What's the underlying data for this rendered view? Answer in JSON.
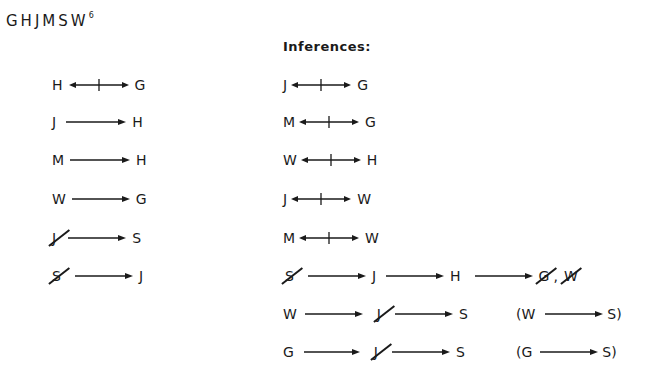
{
  "title": {
    "letters": "GHJMSW",
    "superscript": "6"
  },
  "inferences_heading": "Inferences:",
  "rules": [
    {
      "from": "H",
      "from_neg": false,
      "type": "not-both",
      "to": "G",
      "to_neg": false
    },
    {
      "from": "J",
      "from_neg": false,
      "type": "implies",
      "to": "H",
      "to_neg": false
    },
    {
      "from": "M",
      "from_neg": false,
      "type": "implies",
      "to": "H",
      "to_neg": false
    },
    {
      "from": "W",
      "from_neg": false,
      "type": "implies",
      "to": "G",
      "to_neg": false
    },
    {
      "from": "J",
      "from_neg": true,
      "type": "implies",
      "to": "S",
      "to_neg": false
    },
    {
      "from": "S",
      "from_neg": true,
      "type": "implies",
      "to": "J",
      "to_neg": false
    }
  ],
  "inferences": [
    {
      "from": "J",
      "to": "G",
      "type": "not-both"
    },
    {
      "from": "M",
      "to": "G",
      "type": "not-both"
    },
    {
      "from": "W",
      "to": "H",
      "type": "not-both"
    },
    {
      "from": "J",
      "to": "W",
      "type": "not-both"
    },
    {
      "from": "M",
      "to": "W",
      "type": "not-both"
    }
  ],
  "chain": {
    "t1": "S",
    "t2": "J",
    "t3": "H",
    "t4": "G",
    "comma": ",",
    "t5": "W"
  },
  "chain_w": {
    "t1": "W",
    "t2": "J",
    "t3": "S",
    "summary_open": "(W",
    "summary_close": "S)"
  },
  "chain_g": {
    "t1": "G",
    "t2": "J",
    "t3": "S",
    "summary_open": "(G",
    "summary_close": "S)"
  }
}
